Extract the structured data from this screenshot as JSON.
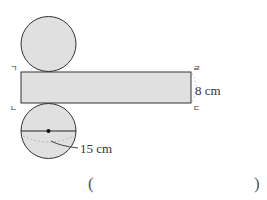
{
  "diagram": {
    "vertex_labels": {
      "top_left": "ㄱ",
      "bottom_left": "ㄴ",
      "top_right": "ㄹ",
      "bottom_right": "ㄷ"
    },
    "height_label": "8 cm",
    "diameter_label": "15 cm",
    "colors": {
      "fill": "#e0e0e0",
      "stroke": "#333333",
      "dashed": "#aaaaaa"
    }
  },
  "answer": {
    "open_paren": "(",
    "close_paren": ")"
  }
}
